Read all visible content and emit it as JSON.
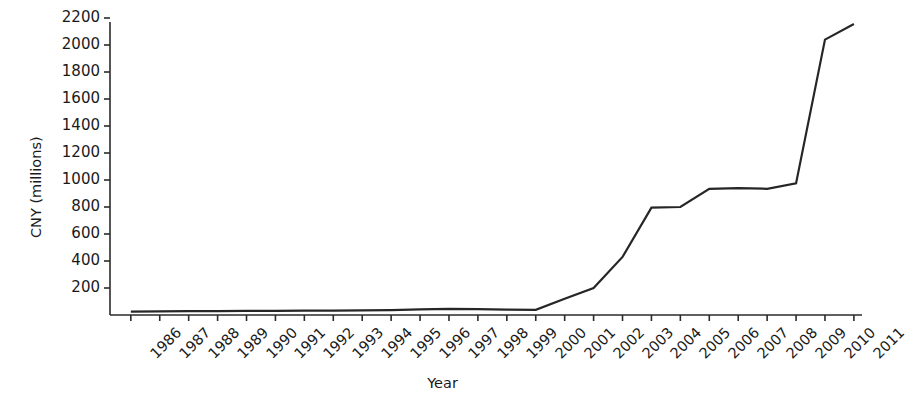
{
  "chart_data": {
    "type": "line",
    "title": "",
    "xlabel": "Year",
    "ylabel": "CNY (millions)",
    "categories": [
      "1986",
      "1987",
      "1988",
      "1989",
      "1990",
      "1991",
      "1992",
      "1993",
      "1994",
      "1995",
      "1996",
      "1997",
      "1998",
      "1999",
      "2000",
      "2001",
      "2002",
      "2003",
      "2004",
      "2005",
      "2006",
      "2007",
      "2008",
      "2009",
      "2010",
      "2011"
    ],
    "values": [
      25,
      27,
      28,
      29,
      30,
      31,
      32,
      33,
      34,
      36,
      42,
      45,
      43,
      40,
      38,
      120,
      200,
      430,
      795,
      800,
      935,
      940,
      935,
      975,
      2040,
      2155
    ],
    "series": [
      {
        "name": "CNY (millions)",
        "values": [
          25,
          27,
          28,
          29,
          30,
          31,
          32,
          33,
          34,
          36,
          42,
          45,
          43,
          40,
          38,
          120,
          200,
          430,
          795,
          800,
          935,
          940,
          935,
          975,
          2040,
          2155
        ]
      }
    ],
    "yticks": [
      200,
      400,
      600,
      800,
      1000,
      1200,
      1400,
      1600,
      1800,
      2000,
      2200
    ],
    "ytick_labels": [
      "200",
      "400",
      "600",
      "800",
      "1000",
      "1200",
      "1400",
      "1600",
      "1800",
      "2000",
      "2200"
    ],
    "xlim": [
      "1986",
      "2011"
    ],
    "ylim": [
      0,
      2300
    ],
    "grid": false,
    "legend": false,
    "legend_position": "none",
    "line_color": "#262626",
    "line_width": 2.2,
    "axis_color": "#2b2b2b",
    "background": "#ffffff"
  }
}
